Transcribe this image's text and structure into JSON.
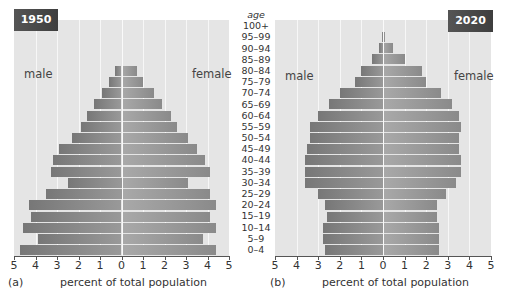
{
  "chart_data": [
    {
      "type": "bar",
      "orientation": "horizontal",
      "subtype": "population-pyramid",
      "title": "1950",
      "panel": "(a)",
      "xlabel": "percent of total population",
      "ylabel": "age",
      "xlim": [
        -5,
        5
      ],
      "xticks": [
        "5",
        "4",
        "3",
        "2",
        "1",
        "0",
        "1",
        "2",
        "3",
        "4",
        "5"
      ],
      "grid": true,
      "categories": [
        "0–4",
        "5–9",
        "10–14",
        "15–19",
        "20–24",
        "25–29",
        "30–34",
        "35–39",
        "40–44",
        "45–49",
        "50–54",
        "55–59",
        "60–64",
        "65–69",
        "70–74",
        "75–79",
        "80–84",
        "85–89",
        "90–94",
        "95–99",
        "100+"
      ],
      "series": [
        {
          "name": "male",
          "values": [
            4.7,
            3.9,
            4.6,
            4.2,
            4.3,
            3.5,
            2.5,
            3.3,
            3.2,
            2.9,
            2.3,
            1.9,
            1.6,
            1.3,
            0.9,
            0.6,
            0.3,
            0,
            0,
            0,
            0
          ]
        },
        {
          "name": "female",
          "values": [
            4.4,
            3.8,
            4.4,
            4.1,
            4.4,
            4.1,
            3.1,
            4.1,
            3.9,
            3.5,
            3.1,
            2.6,
            2.3,
            1.9,
            1.5,
            1.0,
            0.7,
            0,
            0,
            0,
            0
          ]
        }
      ]
    },
    {
      "type": "bar",
      "orientation": "horizontal",
      "subtype": "population-pyramid",
      "title": "2020",
      "panel": "(b)",
      "xlabel": "percent of total population",
      "ylabel": "age",
      "xlim": [
        -5,
        5
      ],
      "xticks": [
        "5",
        "4",
        "3",
        "2",
        "1",
        "0",
        "1",
        "2",
        "3",
        "4",
        "5"
      ],
      "grid": true,
      "categories": [
        "0–4",
        "5–9",
        "10–14",
        "15–19",
        "20–24",
        "25–29",
        "30–34",
        "35–39",
        "40–44",
        "45–49",
        "50–54",
        "55–59",
        "60–64",
        "65–69",
        "70–74",
        "75–79",
        "80–84",
        "85–89",
        "90–94",
        "95–99",
        "100+"
      ],
      "series": [
        {
          "name": "male",
          "values": [
            2.7,
            2.8,
            2.8,
            2.6,
            2.7,
            3.0,
            3.6,
            3.6,
            3.6,
            3.5,
            3.4,
            3.4,
            3.0,
            2.5,
            2.0,
            1.3,
            1.0,
            0.5,
            0.2,
            0.05,
            0.02
          ]
        },
        {
          "name": "female",
          "values": [
            2.6,
            2.6,
            2.6,
            2.5,
            2.5,
            2.9,
            3.4,
            3.6,
            3.6,
            3.5,
            3.5,
            3.6,
            3.5,
            3.2,
            2.7,
            2.0,
            1.8,
            1.0,
            0.45,
            0.1,
            0.03
          ]
        }
      ]
    }
  ],
  "panels": [
    {
      "badge": "1950",
      "male_label": "male",
      "female_label": "female",
      "panel_label": "(a)",
      "xlabel": "percent of total population"
    },
    {
      "badge": "2020",
      "male_label": "male",
      "female_label": "female",
      "panel_label": "(b)",
      "xlabel": "percent of total population"
    }
  ],
  "age_header": "age",
  "age_labels_top_down": [
    "100+",
    "95–99",
    "90–94",
    "85–89",
    "80–84",
    "75–79",
    "70–74",
    "65–69",
    "60–64",
    "55–59",
    "50–54",
    "45–49",
    "40–44",
    "35–39",
    "30–34",
    "25–29",
    "20–24",
    "15–19",
    "10–14",
    "5–9",
    "0–4"
  ],
  "colors": {
    "plot_bg": "#e5e5e5",
    "male_bar": "#888888",
    "female_bar": "#9c9c9c",
    "badge_bg": "#484848",
    "grid": "#f7f7f7"
  }
}
